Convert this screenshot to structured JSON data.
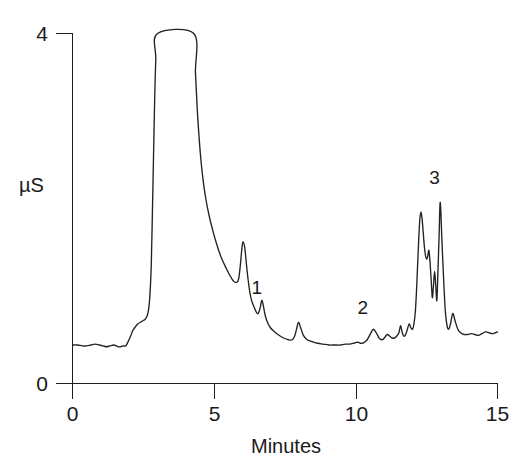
{
  "figure": {
    "kind": "chromatogram",
    "background_color": "#ffffff",
    "line_color": "#222222",
    "axis_color": "#1d1d1d",
    "text_color": "#1a1a1a"
  },
  "chart_data": {
    "type": "line",
    "title": "",
    "subtitle": "",
    "xlabel": "Minutes",
    "ylabel": "µS",
    "xlim": [
      0,
      15
    ],
    "ylim": [
      0,
      4
    ],
    "xticks": [
      0,
      5,
      10,
      15
    ],
    "xtick_labels": [
      "0",
      "5",
      "10",
      "15"
    ],
    "yticks": [
      0,
      4
    ],
    "ytick_labels": [
      "0",
      "4"
    ],
    "grid": false,
    "legend": null,
    "series": [
      {
        "name": "conductivity",
        "clipped_above": 4,
        "x": [
          0.0,
          0.18,
          0.35,
          0.5,
          0.65,
          0.8,
          0.95,
          1.08,
          1.2,
          1.32,
          1.45,
          1.55,
          1.62,
          1.7,
          1.78,
          1.88,
          1.95,
          2.05,
          2.12,
          2.2,
          2.3,
          2.4,
          2.5,
          2.58,
          2.66,
          2.72,
          2.78,
          2.82,
          2.86,
          2.9,
          2.94,
          3.0,
          4.28,
          4.34,
          4.4,
          4.46,
          4.52,
          4.6,
          4.7,
          4.82,
          4.95,
          5.1,
          5.25,
          5.42,
          5.58,
          5.72,
          5.85,
          5.92,
          5.98,
          6.02,
          6.08,
          6.14,
          6.2,
          6.26,
          6.32,
          6.4,
          6.48,
          6.55,
          6.62,
          6.68,
          6.74,
          6.8,
          6.88,
          6.98,
          7.1,
          7.25,
          7.45,
          7.62,
          7.75,
          7.85,
          7.92,
          7.98,
          8.05,
          8.15,
          8.28,
          8.45,
          8.65,
          8.85,
          9.05,
          9.25,
          9.45,
          9.62,
          9.78,
          9.92,
          10.02,
          10.1,
          10.16,
          10.22,
          10.3,
          10.4,
          10.52,
          10.62,
          10.72,
          10.82,
          10.9,
          10.98,
          11.05,
          11.12,
          11.2,
          11.28,
          11.36,
          11.44,
          11.52,
          11.58,
          11.64,
          11.7,
          11.76,
          11.82,
          11.88,
          11.94,
          12.0,
          12.05,
          12.1,
          12.14,
          12.18,
          12.22,
          12.26,
          12.3,
          12.34,
          12.38,
          12.42,
          12.46,
          12.5,
          12.54,
          12.58,
          12.62,
          12.66,
          12.7,
          12.74,
          12.78,
          12.82,
          12.86,
          12.9,
          12.94,
          12.98,
          13.04,
          13.1,
          13.16,
          13.22,
          13.28,
          13.34,
          13.42,
          13.5,
          13.6,
          13.7,
          13.82,
          13.95,
          14.08,
          14.2,
          14.32,
          14.45,
          14.58,
          14.7,
          14.82,
          14.92,
          15.0
        ],
        "y": [
          0.44,
          0.44,
          0.43,
          0.43,
          0.44,
          0.45,
          0.44,
          0.43,
          0.42,
          0.43,
          0.44,
          0.43,
          0.42,
          0.42,
          0.43,
          0.43,
          0.47,
          0.54,
          0.6,
          0.64,
          0.68,
          0.7,
          0.72,
          0.74,
          0.8,
          0.95,
          1.35,
          1.95,
          2.6,
          3.25,
          3.7,
          4.0,
          4.0,
          3.55,
          3.15,
          2.85,
          2.6,
          2.35,
          2.12,
          1.92,
          1.75,
          1.58,
          1.44,
          1.32,
          1.22,
          1.16,
          1.18,
          1.34,
          1.55,
          1.62,
          1.55,
          1.36,
          1.18,
          1.04,
          0.95,
          0.88,
          0.82,
          0.8,
          0.86,
          0.95,
          0.88,
          0.78,
          0.7,
          0.64,
          0.6,
          0.56,
          0.52,
          0.5,
          0.5,
          0.55,
          0.64,
          0.7,
          0.64,
          0.55,
          0.5,
          0.48,
          0.46,
          0.45,
          0.44,
          0.44,
          0.44,
          0.45,
          0.45,
          0.46,
          0.47,
          0.47,
          0.46,
          0.46,
          0.47,
          0.5,
          0.57,
          0.62,
          0.58,
          0.52,
          0.5,
          0.51,
          0.54,
          0.56,
          0.54,
          0.52,
          0.52,
          0.54,
          0.58,
          0.66,
          0.58,
          0.54,
          0.56,
          0.62,
          0.68,
          0.64,
          0.62,
          0.68,
          0.82,
          1.05,
          1.35,
          1.65,
          1.88,
          1.96,
          1.88,
          1.72,
          1.56,
          1.46,
          1.42,
          1.46,
          1.52,
          1.38,
          1.18,
          0.98,
          1.12,
          1.28,
          1.12,
          0.95,
          1.3,
          1.7,
          2.07,
          1.62,
          1.18,
          0.82,
          0.66,
          0.62,
          0.68,
          0.8,
          0.72,
          0.62,
          0.58,
          0.56,
          0.56,
          0.57,
          0.56,
          0.55,
          0.57,
          0.59,
          0.58,
          0.57,
          0.58,
          0.59
        ]
      }
    ],
    "annotations": [
      {
        "label": "1",
        "x": 6.5,
        "y": 1.02,
        "peak_x": 6.45,
        "peak_y": 0.95
      },
      {
        "label": "2",
        "x": 10.25,
        "y": 0.8,
        "peak_x": 10.22,
        "peak_y": 0.62
      },
      {
        "label": "3",
        "x": 12.78,
        "y": 2.28,
        "peak_x": 12.76,
        "peak_y": 2.07
      }
    ]
  }
}
